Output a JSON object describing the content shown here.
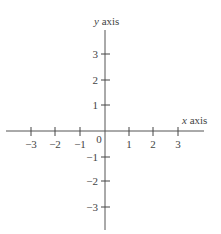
{
  "diagram": {
    "type": "cartesian-axes",
    "x_axis": {
      "label_var": "x",
      "label_word": "axis",
      "ticks": [
        {
          "value": -3,
          "label": "−3"
        },
        {
          "value": -2,
          "label": "−2"
        },
        {
          "value": -1,
          "label": "−1"
        },
        {
          "value": 1,
          "label": "1"
        },
        {
          "value": 2,
          "label": "2"
        },
        {
          "value": 3,
          "label": "3"
        }
      ]
    },
    "y_axis": {
      "label_var": "y",
      "label_word": "axis",
      "ticks": [
        {
          "value": 3,
          "label": "3"
        },
        {
          "value": 2,
          "label": "2"
        },
        {
          "value": 1,
          "label": "1"
        },
        {
          "value": -1,
          "label": "−1"
        },
        {
          "value": -2,
          "label": "−2"
        },
        {
          "value": -3,
          "label": "−3"
        }
      ]
    },
    "origin_label": "0",
    "colors": {
      "axis": "#555555",
      "text": "#444444"
    }
  }
}
